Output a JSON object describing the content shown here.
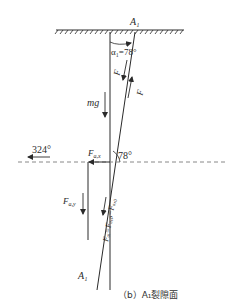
{
  "diagram": {
    "caption": "（b）A₁裂隙面",
    "points": {
      "top": "A₁",
      "bottom": "A₁"
    },
    "angles": {
      "top_angle": "α₁=78°",
      "dip_angle": "78°",
      "direction": "324°"
    },
    "forces": {
      "gravity": "mg",
      "f_ax_label": "F",
      "f_ax_sub": "a,x",
      "f_ay_label": "F",
      "f_ay_sub": "a,y",
      "f_aN_label": "F",
      "f_aN_sub": "a,N",
      "f_aP_label": "F",
      "f_aP_sub": "a,p",
      "f_along_label": "F",
      "f_along_sub": "a,p",
      "resultant": "Fₐᵢ=Fₐ,ₚ−Fₐ,₀"
    },
    "colors": {
      "line": "#2a2a2a",
      "dashed": "#888888",
      "background": "#ffffff"
    }
  }
}
